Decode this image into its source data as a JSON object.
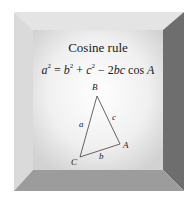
{
  "card": {
    "title": "Cosine rule",
    "formula": {
      "lhs_var": "a",
      "lhs_exp": "2",
      "eq": " = ",
      "t1_var": "b",
      "t1_exp": "2",
      "plus": " + ",
      "t2_var": "c",
      "t2_exp": "2",
      "minus": " − 2",
      "t3_vars": "bc",
      "cos": " cos ",
      "angle": "A"
    },
    "triangle": {
      "vertices": {
        "A": "A",
        "B": "B",
        "C": "C"
      },
      "sides": {
        "a": "a",
        "b": "b",
        "c": "c"
      }
    },
    "colors": {
      "top_bevel": "#e6e6e6",
      "left_bevel": "#dcdcdc",
      "right_bevel": "#6e6e6e",
      "bottom_bevel": "#9a9a9a",
      "panel_center": "#ffffff",
      "panel_edge": "#d4d4d4",
      "line": "#555555"
    }
  }
}
